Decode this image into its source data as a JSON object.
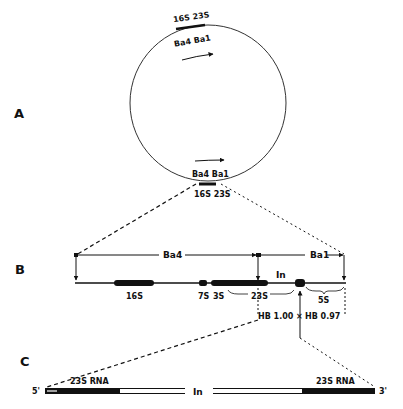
{
  "figure": {
    "panels": {
      "a": {
        "label": "A"
      },
      "b": {
        "label": "B"
      },
      "c": {
        "label": "C"
      }
    },
    "plasmid_map": {
      "top_labels": {
        "rrna": "16S 23S",
        "probes": "Ba4 Ba1"
      },
      "bottom_labels": {
        "probes": "Ba4 Ba1",
        "rrna": "16S 23S"
      }
    },
    "operon_map": {
      "fragments": [
        {
          "name": "Ba4"
        },
        {
          "name": "Ba1"
        }
      ],
      "genes": [
        {
          "name": "16S"
        },
        {
          "name": "7S"
        },
        {
          "name": "3S"
        },
        {
          "name": "23S"
        },
        {
          "name": "5S"
        }
      ],
      "intron_label": "In",
      "fragment_ends": [
        {
          "name": "HB 1.00"
        },
        {
          "name": "HB 0.97"
        }
      ]
    },
    "rna_map": {
      "five_prime": "5'",
      "three_prime": "3'",
      "left_rna": "23S RNA",
      "right_rna": "23S RNA",
      "intron_label": "In"
    }
  }
}
